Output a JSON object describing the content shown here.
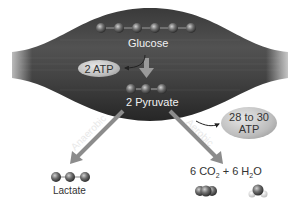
{
  "diagram": {
    "nodes": {
      "glucose": {
        "label": "Glucose",
        "molecule_atoms": 6
      },
      "atp_glycolysis": {
        "label": "2 ATP"
      },
      "pyruvate": {
        "label": "2 Pyruvate",
        "molecule_atoms": 3
      },
      "lactate": {
        "label": "Lactate",
        "molecule_atoms": 3
      },
      "aerobic_products": {
        "label_prefix": "6 CO",
        "sub1": "2",
        "label_mid": " + 6 H",
        "sub2": "2",
        "label_suffix": "O"
      },
      "atp_aerobic": {
        "line1": "28 to 30",
        "line2": "ATP"
      }
    },
    "edges": [
      {
        "from": "glucose",
        "to": "pyruvate",
        "label": ""
      },
      {
        "from": "pyruvate",
        "to": "lactate",
        "label": "Anaerobic"
      },
      {
        "from": "pyruvate",
        "to": "aerobic_products",
        "label": "Aerobic"
      }
    ],
    "colors": {
      "muscle": "#4a4a4a",
      "arrow": "#8c8c8c",
      "atom": "#6a6a6a",
      "pill": "#c4c4c4",
      "text_dark": "#333333",
      "text_light": "#f2f2f2"
    }
  }
}
